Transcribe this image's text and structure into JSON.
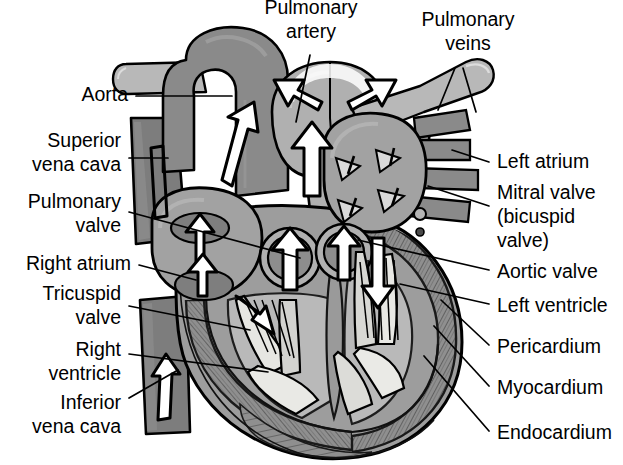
{
  "diagram": {
    "style": "grayscale line drawing, labelled with leader lines",
    "blood_flow_arrows": "hollow black outlined arrows indicate direction of blood flow"
  },
  "colors": {
    "background": "#ffffff",
    "outline": "#000000",
    "vessel_dark_gray": "#7d7d7d",
    "vessel_mid_gray": "#8a8a8a",
    "vessel_light_gray": "#b8b8b8",
    "chamber_gray": "#9d9d9d",
    "myocardium_gray": "#8f8f8f",
    "lumen_light": "#d8d8d8",
    "valve_cream": "#e8e8e4",
    "text": "#000000"
  },
  "labels": {
    "top": [
      {
        "id": "pulmonary-artery",
        "text_lines": [
          "Pulmonary",
          "artery"
        ],
        "x": 311,
        "y": 14,
        "align": "middle"
      },
      {
        "id": "pulmonary-veins",
        "text_lines": [
          "Pulmonary",
          "veins"
        ],
        "x": 468,
        "y": 26,
        "align": "middle"
      }
    ],
    "left": [
      {
        "id": "aorta",
        "text_lines": [
          "Aorta"
        ],
        "x": 128,
        "y": 101,
        "align": "end"
      },
      {
        "id": "superior-vena-cava",
        "text_lines": [
          "Superior",
          "vena cava"
        ],
        "x": 121,
        "y": 147,
        "align": "end"
      },
      {
        "id": "pulmonary-valve",
        "text_lines": [
          "Pulmonary",
          "valve"
        ],
        "x": 121,
        "y": 208,
        "align": "end"
      },
      {
        "id": "right-atrium",
        "text_lines": [
          "Right atrium"
        ],
        "x": 131,
        "y": 270,
        "align": "end"
      },
      {
        "id": "tricuspid-valve",
        "text_lines": [
          "Tricuspid",
          "valve"
        ],
        "x": 121,
        "y": 300,
        "align": "end"
      },
      {
        "id": "right-ventricle",
        "text_lines": [
          "Right",
          "ventricle"
        ],
        "x": 121,
        "y": 348,
        "align": "end"
      },
      {
        "id": "inferior-vena-cava",
        "text_lines": [
          "Inferior",
          "vena cava"
        ],
        "x": 121,
        "y": 401,
        "align": "end"
      }
    ],
    "right": [
      {
        "id": "left-atrium",
        "text_lines": [
          "Left atrium"
        ],
        "x": 497,
        "y": 168,
        "align": "start"
      },
      {
        "id": "mitral-valve",
        "text_lines": [
          "Mitral valve",
          "(bicuspid",
          "valve)"
        ],
        "x": 497,
        "y": 199,
        "align": "start"
      },
      {
        "id": "aortic-valve",
        "text_lines": [
          "Aortic valve"
        ],
        "x": 497,
        "y": 276,
        "align": "start"
      },
      {
        "id": "left-ventricle",
        "text_lines": [
          "Left ventricle"
        ],
        "x": 497,
        "y": 310,
        "align": "start"
      },
      {
        "id": "pericardium",
        "text_lines": [
          "Pericardium"
        ],
        "x": 497,
        "y": 351,
        "align": "start"
      },
      {
        "id": "myocardium",
        "text_lines": [
          "Myocardium"
        ],
        "x": 497,
        "y": 392,
        "align": "start"
      },
      {
        "id": "endocardium",
        "text_lines": [
          "Endocardium"
        ],
        "x": 497,
        "y": 437,
        "align": "start"
      }
    ]
  },
  "structures": [
    {
      "id": "aorta",
      "name": "Aorta",
      "kind": "great vessel",
      "shade": "mid_gray"
    },
    {
      "id": "pulmonary-artery",
      "name": "Pulmonary artery",
      "kind": "great vessel",
      "shade": "light_gray"
    },
    {
      "id": "pulmonary-veins",
      "name": "Pulmonary veins",
      "kind": "vessel",
      "shade": "dark_gray",
      "count": 4
    },
    {
      "id": "superior-vena-cava",
      "name": "Superior vena cava",
      "kind": "great vein",
      "shade": "dark_gray"
    },
    {
      "id": "inferior-vena-cava",
      "name": "Inferior vena cava",
      "kind": "great vein",
      "shade": "dark_gray"
    },
    {
      "id": "right-atrium",
      "name": "Right atrium",
      "kind": "chamber"
    },
    {
      "id": "left-atrium",
      "name": "Left atrium",
      "kind": "chamber"
    },
    {
      "id": "right-ventricle",
      "name": "Right ventricle",
      "kind": "chamber"
    },
    {
      "id": "left-ventricle",
      "name": "Left ventricle",
      "kind": "chamber"
    },
    {
      "id": "pulmonary-valve",
      "name": "Pulmonary valve",
      "kind": "semilunar valve"
    },
    {
      "id": "aortic-valve",
      "name": "Aortic valve",
      "kind": "semilunar valve"
    },
    {
      "id": "tricuspid-valve",
      "name": "Tricuspid valve",
      "kind": "atrioventricular valve"
    },
    {
      "id": "mitral-valve",
      "name": "Mitral valve (bicuspid valve)",
      "kind": "atrioventricular valve"
    },
    {
      "id": "pericardium",
      "name": "Pericardium",
      "kind": "wall layer"
    },
    {
      "id": "myocardium",
      "name": "Myocardium",
      "kind": "wall layer"
    },
    {
      "id": "endocardium",
      "name": "Endocardium",
      "kind": "wall layer"
    }
  ]
}
